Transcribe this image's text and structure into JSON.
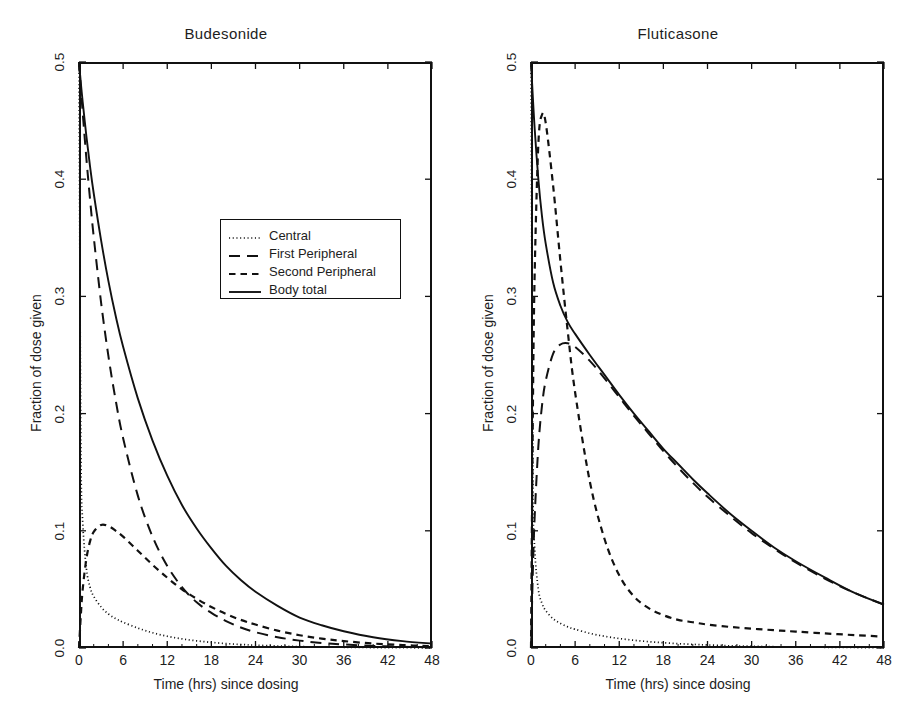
{
  "figure": {
    "background": "#ffffff",
    "ink": "#111111"
  },
  "axes": {
    "xlabel": "Time (hrs) since dosing",
    "ylabel": "Fraction of dose given",
    "xticks": [
      "0",
      "6",
      "12",
      "18",
      "24",
      "30",
      "36",
      "42",
      "48"
    ],
    "yticks": [
      "0.0",
      "0.1",
      "0.2",
      "0.3",
      "0.4",
      "0.5"
    ],
    "xlim": [
      0,
      48
    ],
    "ylim": [
      0,
      0.5
    ]
  },
  "legend": {
    "entries": [
      {
        "label": "Central",
        "style": "dotted"
      },
      {
        "label": "First Peripheral",
        "style": "long-dash"
      },
      {
        "label": "Second Peripheral",
        "style": "short-dash"
      },
      {
        "label": "Body total",
        "style": "solid"
      }
    ]
  },
  "panels": [
    {
      "id": "left",
      "title": "Budesonide"
    },
    {
      "id": "right",
      "title": "Fluticasone"
    }
  ],
  "chart_data": [
    {
      "type": "line",
      "title": "Budesonide",
      "xlabel": "Time (hrs) since dosing",
      "ylabel": "Fraction of dose given",
      "xlim": [
        0,
        48
      ],
      "ylim": [
        0,
        0.5
      ],
      "xticks": [
        0,
        6,
        12,
        18,
        24,
        30,
        36,
        42,
        48
      ],
      "yticks": [
        0.0,
        0.1,
        0.2,
        0.3,
        0.4,
        0.5
      ],
      "grid": false,
      "legend_position": "upper-center-right",
      "x": [
        0,
        0.25,
        0.5,
        1,
        1.5,
        2,
        3,
        4,
        5,
        6,
        8,
        10,
        12,
        14,
        16,
        18,
        20,
        22,
        24,
        27,
        30,
        33,
        36,
        40,
        44,
        48
      ],
      "series": [
        {
          "name": "Central",
          "style": "dotted",
          "values": [
            0.5,
            0.175,
            0.108,
            0.068,
            0.052,
            0.044,
            0.035,
            0.029,
            0.025,
            0.022,
            0.017,
            0.013,
            0.01,
            0.0078,
            0.0061,
            0.0048,
            0.0038,
            0.003,
            0.0024,
            0.0017,
            0.0012,
            0.00085,
            0.0006,
            0.00037,
            0.00023,
            0.00014
          ]
        },
        {
          "name": "First Peripheral",
          "style": "long-dash",
          "values": [
            0.5,
            0.478,
            0.457,
            0.418,
            0.383,
            0.351,
            0.295,
            0.249,
            0.211,
            0.179,
            0.13,
            0.095,
            0.07,
            0.052,
            0.039,
            0.03,
            0.023,
            0.0175,
            0.0135,
            0.0092,
            0.0063,
            0.0043,
            0.003,
            0.0018,
            0.0011,
            0.00066
          ]
        },
        {
          "name": "Second Peripheral",
          "style": "short-dash",
          "values": [
            0.0,
            0.028,
            0.05,
            0.076,
            0.091,
            0.099,
            0.105,
            0.104,
            0.1,
            0.095,
            0.083,
            0.071,
            0.06,
            0.05,
            0.042,
            0.035,
            0.029,
            0.024,
            0.02,
            0.0148,
            0.0109,
            0.008,
            0.0059,
            0.0038,
            0.0025,
            0.0016
          ]
        },
        {
          "name": "Body total",
          "style": "solid",
          "values": [
            0.5,
            0.482,
            0.466,
            0.437,
            0.411,
            0.388,
            0.348,
            0.313,
            0.283,
            0.257,
            0.213,
            0.177,
            0.147,
            0.122,
            0.102,
            0.085,
            0.07,
            0.058,
            0.048,
            0.036,
            0.026,
            0.0194,
            0.0143,
            0.0092,
            0.0059,
            0.0038
          ]
        }
      ]
    },
    {
      "type": "line",
      "title": "Fluticasone",
      "xlabel": "Time (hrs) since dosing",
      "ylabel": "Fraction of dose given",
      "xlim": [
        0,
        48
      ],
      "ylim": [
        0,
        0.5
      ],
      "xticks": [
        0,
        6,
        12,
        18,
        24,
        30,
        36,
        42,
        48
      ],
      "yticks": [
        0.0,
        0.1,
        0.2,
        0.3,
        0.4,
        0.5
      ],
      "grid": false,
      "legend_position": "upper-center-right",
      "x": [
        0,
        0.25,
        0.5,
        1,
        1.5,
        2,
        3,
        4,
        5,
        6,
        8,
        10,
        12,
        14,
        16,
        18,
        20,
        22,
        24,
        27,
        30,
        33,
        36,
        40,
        44,
        48
      ],
      "series": [
        {
          "name": "Central",
          "style": "dotted",
          "values": [
            0.5,
            0.15,
            0.085,
            0.05,
            0.038,
            0.032,
            0.025,
            0.021,
            0.018,
            0.016,
            0.0125,
            0.01,
            0.0081,
            0.0066,
            0.0054,
            0.0045,
            0.0037,
            0.0031,
            0.0026,
            0.0019,
            0.0015,
            0.0011,
            0.00085,
            0.0006,
            0.00042,
            0.0003
          ]
        },
        {
          "name": "First Peripheral",
          "style": "long-dash",
          "values": [
            0.0,
            0.065,
            0.112,
            0.172,
            0.207,
            0.228,
            0.251,
            0.259,
            0.26,
            0.257,
            0.245,
            0.23,
            0.214,
            0.198,
            0.183,
            0.168,
            0.154,
            0.141,
            0.129,
            0.113,
            0.098,
            0.085,
            0.073,
            0.059,
            0.047,
            0.037
          ]
        },
        {
          "name": "Second Peripheral",
          "style": "short-dash",
          "values": [
            0.0,
            0.2,
            0.32,
            0.43,
            0.455,
            0.448,
            0.395,
            0.33,
            0.27,
            0.218,
            0.142,
            0.093,
            0.062,
            0.044,
            0.034,
            0.028,
            0.024,
            0.022,
            0.02,
            0.018,
            0.0165,
            0.0152,
            0.014,
            0.0124,
            0.011,
            0.0097
          ]
        },
        {
          "name": "Body total",
          "style": "solid",
          "values": [
            0.5,
            0.47,
            0.443,
            0.4,
            0.368,
            0.345,
            0.312,
            0.292,
            0.278,
            0.268,
            0.25,
            0.233,
            0.216,
            0.2,
            0.185,
            0.17,
            0.157,
            0.144,
            0.132,
            0.115,
            0.1,
            0.086,
            0.074,
            0.06,
            0.047,
            0.037
          ]
        }
      ]
    }
  ]
}
